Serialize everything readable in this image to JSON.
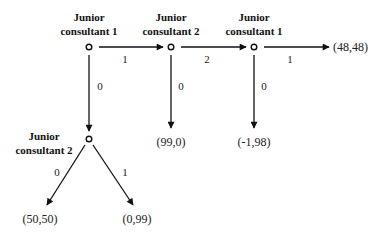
{
  "diagram": {
    "type": "game-tree",
    "nodes": [
      {
        "id": "n1",
        "player": [
          "Junior",
          "consultant 1"
        ],
        "x": 89,
        "y": 47
      },
      {
        "id": "n2",
        "player": [
          "Junior",
          "consultant 2"
        ],
        "x": 171,
        "y": 47
      },
      {
        "id": "n3",
        "player": [
          "Junior",
          "consultant 1"
        ],
        "x": 254,
        "y": 47
      },
      {
        "id": "n4",
        "player": [
          "Junior",
          "consultant 2"
        ],
        "x": 89,
        "y": 139
      }
    ],
    "edges": [
      {
        "from": "n1",
        "to": "n2",
        "label": "1"
      },
      {
        "from": "n1",
        "to": "n4",
        "label": "0"
      },
      {
        "from": "n2",
        "to": "n3",
        "label": "2"
      },
      {
        "from": "n2",
        "to": "p_99_0",
        "label": "0"
      },
      {
        "from": "n3",
        "to": "p_48_48",
        "label": "1"
      },
      {
        "from": "n3",
        "to": "p_m1_98",
        "label": "0"
      },
      {
        "from": "n4",
        "to": "p_50_50",
        "label": "0"
      },
      {
        "from": "n4",
        "to": "p_0_99",
        "label": "1"
      }
    ],
    "payoffs": {
      "p_48_48": "(48,48)",
      "p_99_0": "(99,0)",
      "p_m1_98": "(-1,98)",
      "p_50_50": "(50,50)",
      "p_0_99": "(0,99)"
    },
    "labels": {
      "n1_line1": "Junior",
      "n1_line2": "consultant 1",
      "n2_line1": "Junior",
      "n2_line2": "consultant 2",
      "n3_line1": "Junior",
      "n3_line2": "consultant 1",
      "n4_line1": "Junior",
      "n4_line2": "consultant 2",
      "e_n1_n2": "1",
      "e_n1_n4": "0",
      "e_n2_n3": "2",
      "e_n2_down": "0",
      "e_n3_right": "1",
      "e_n3_down": "0",
      "e_n4_left": "0",
      "e_n4_right": "1"
    }
  }
}
